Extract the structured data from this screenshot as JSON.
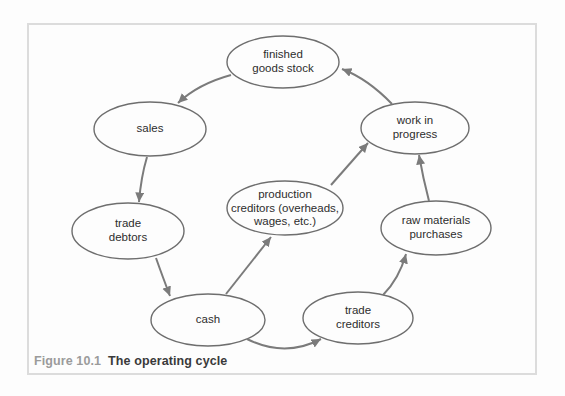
{
  "figure": {
    "caption_label": "Figure 10.1",
    "caption_title": "The operating cycle"
  },
  "colors": {
    "background": "#fdfdfd",
    "frame_border": "#dcdcdc",
    "node_stroke": "#6e6e6e",
    "node_fill": "#fdfdfd",
    "arrow": "#7b7b7b",
    "label_text": "#2d2d2d",
    "caption_label_color": "#9b9b9b",
    "caption_title_color": "#3a3a3a"
  },
  "diagram": {
    "title": "The operating cycle",
    "nodes": [
      {
        "id": "finished-goods-stock",
        "lines": [
          "finished",
          "goods stock"
        ],
        "cx": 283,
        "cy": 62,
        "rx": 56,
        "ry": 26
      },
      {
        "id": "sales",
        "lines": [
          "sales"
        ],
        "cx": 150,
        "cy": 129,
        "rx": 56,
        "ry": 27
      },
      {
        "id": "trade-debtors",
        "lines": [
          "trade",
          "debtors"
        ],
        "cx": 128,
        "cy": 231,
        "rx": 56,
        "ry": 28
      },
      {
        "id": "cash",
        "lines": [
          "cash"
        ],
        "cx": 208,
        "cy": 320,
        "rx": 57,
        "ry": 26
      },
      {
        "id": "production-creditors",
        "lines": [
          "production",
          "creditors (overheads,",
          "wages, etc.)"
        ],
        "cx": 285,
        "cy": 208,
        "rx": 58,
        "ry": 27
      },
      {
        "id": "trade-creditors",
        "lines": [
          "trade",
          "creditors"
        ],
        "cx": 358,
        "cy": 318,
        "rx": 55,
        "ry": 26
      },
      {
        "id": "raw-materials-purchases",
        "lines": [
          "raw materials",
          "purchases"
        ],
        "cx": 436,
        "cy": 228,
        "rx": 55,
        "ry": 27
      },
      {
        "id": "work-in-progress",
        "lines": [
          "work in",
          "progress"
        ],
        "cx": 415,
        "cy": 128,
        "rx": 54,
        "ry": 26
      }
    ],
    "edges": [
      {
        "from": "finished-goods-stock",
        "to": "sales",
        "path": "M 231 75 Q 198 84 178 103"
      },
      {
        "from": "sales",
        "to": "trade-debtors",
        "path": "M 147 157 Q 141 177 139 202"
      },
      {
        "from": "trade-debtors",
        "to": "cash",
        "path": "M 156 258 Q 162 275 170 296"
      },
      {
        "from": "cash",
        "to": "trade-creditors",
        "path": "M 247 339 Q 285 358 321 339"
      },
      {
        "from": "cash",
        "to": "production-creditors",
        "path": "M 226 294 L 271 237"
      },
      {
        "from": "trade-creditors",
        "to": "raw-materials-purchases",
        "path": "M 383 295 Q 399 279 406 254"
      },
      {
        "from": "raw-materials-purchases",
        "to": "work-in-progress",
        "path": "M 429 201 Q 423 178 419 155"
      },
      {
        "from": "production-creditors",
        "to": "work-in-progress",
        "path": "M 331 185 L 368 143"
      },
      {
        "from": "work-in-progress",
        "to": "finished-goods-stock",
        "path": "M 392 104 Q 368 79 342 69"
      }
    ]
  }
}
